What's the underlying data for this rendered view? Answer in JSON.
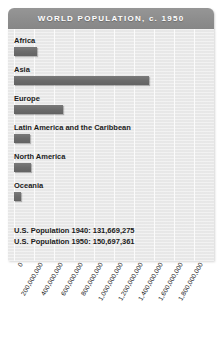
{
  "title": "WORLD POPULATION, c. 1950",
  "annotation": {
    "line1": "U.S. Population 1940: 131,669,275",
    "line2": "U.S. Population 1950: 150,697,361"
  },
  "colors": {
    "title_bar": "#8d8d8d",
    "panel": "#ebebeb",
    "bar": "#6b6b6b",
    "gridline": "#fbfbfb",
    "text": "#1b1b1b"
  },
  "chart_data": {
    "type": "bar",
    "orientation": "horizontal",
    "title": "WORLD POPULATION, c. 1950",
    "xlabel": "",
    "ylabel": "",
    "grid": true,
    "legend": "none",
    "xlim": [
      0,
      2000000000
    ],
    "categories": [
      "Africa",
      "Asia",
      "Europe",
      "Latin America and the Caribbean",
      "North America",
      "Oceania"
    ],
    "values": [
      225000000,
      1350000000,
      490000000,
      160000000,
      165000000,
      65000000
    ],
    "tick_labels": [
      "0",
      "200,000,000",
      "400,000,000",
      "600,000,000",
      "800,000,000",
      "1,000,000,000",
      "1,200,000,000",
      "1,400,000,000",
      "1,600,000,000",
      "1,800,000,000"
    ],
    "tick_values": [
      0,
      200000000,
      400000000,
      600000000,
      800000000,
      1000000000,
      1200000000,
      1400000000,
      1600000000,
      1800000000
    ],
    "annotations": [
      "U.S. Population 1940: 131,669,275",
      "U.S. Population 1950: 150,697,361"
    ]
  }
}
